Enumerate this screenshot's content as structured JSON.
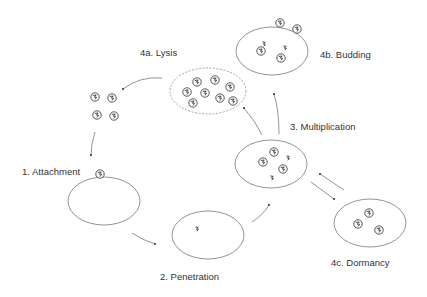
{
  "diagram": {
    "stages": [
      {
        "id": "attachment",
        "label": "1. Attachment"
      },
      {
        "id": "penetration",
        "label": "2. Penetration"
      },
      {
        "id": "multiplication",
        "label": "3. Multiplication"
      },
      {
        "id": "lysis",
        "label": "4a. Lysis"
      },
      {
        "id": "budding",
        "label": "4b. Budding"
      },
      {
        "id": "dormancy",
        "label": "4c. Dormancy"
      }
    ],
    "colors": {
      "cell_outline": "#888888",
      "virus_outline": "#444444",
      "arrow": "#777777",
      "text": "#333333",
      "background": "#ffffff"
    },
    "flow": [
      "free-virions -> attachment",
      "attachment -> penetration",
      "penetration -> multiplication",
      "multiplication -> lysis",
      "multiplication -> budding",
      "multiplication <-> dormancy",
      "lysis -> free-virions"
    ]
  }
}
